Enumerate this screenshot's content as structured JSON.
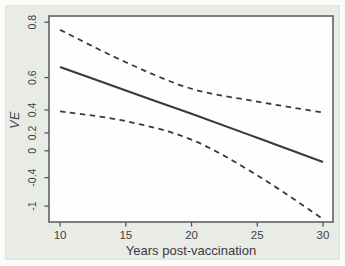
{
  "figure": {
    "colors": {
      "panel_background": "#e9ebe7",
      "plot_background": "#fefefe",
      "plot_border": "#5f6366",
      "line_color": "#3a3a3a",
      "tick_color": "#55585a",
      "text_color": "#3f3f3f"
    }
  },
  "chart_data": {
    "type": "line",
    "title": "",
    "xlabel": "Years post-vaccination",
    "ylabel": "VE",
    "y_scale": "log(1-VE) transformed axis",
    "grid": false,
    "legend": "none",
    "xlim": [
      9.16,
      30.76
    ],
    "ylim_ve": [
      -1.44,
      0.815
    ],
    "x_ticks": [
      10,
      15,
      20,
      25,
      30
    ],
    "x_tick_labels": [
      "10",
      "15",
      "20",
      "25",
      "30"
    ],
    "y_ticks": [
      0.8,
      0.6,
      0.4,
      0.2,
      0,
      -0.4,
      -1
    ],
    "y_tick_labels": [
      "0.8",
      "0.6",
      "0.4",
      "0.2",
      "0",
      "-0.4",
      "-1"
    ],
    "series": [
      {
        "name": "VE point estimate",
        "style": "solid",
        "x": [
          10,
          15,
          20,
          25,
          30
        ],
        "y": [
          0.65,
          0.53,
          0.37,
          0.15,
          -0.15
        ]
      },
      {
        "name": "upper 95% CI",
        "style": "dashed",
        "x": [
          10,
          15,
          20,
          25,
          30
        ],
        "y": [
          0.78,
          0.67,
          0.54,
          0.46,
          0.38
        ]
      },
      {
        "name": "lower 95% CI",
        "style": "dashed",
        "x": [
          10,
          15,
          20,
          25,
          30
        ],
        "y": [
          0.39,
          0.31,
          0.13,
          -0.36,
          -1.35
        ]
      }
    ]
  }
}
